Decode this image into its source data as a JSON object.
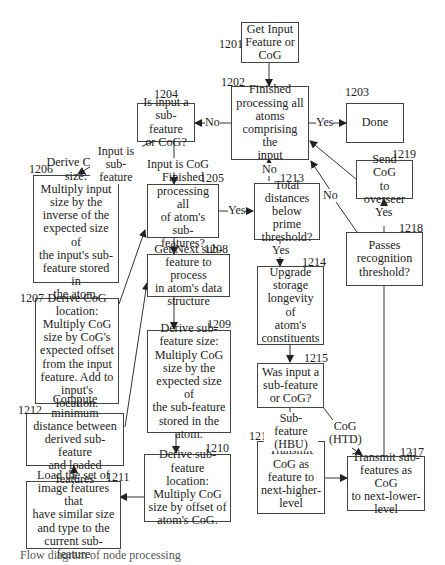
{
  "diagram": {
    "type": "flowchart",
    "nodes": {
      "n1201": {
        "ref": "1201",
        "text": "Get Input\nFeature or\nCoG"
      },
      "n1202": {
        "ref": "1202",
        "text": "Finished\nprocessing all\natoms\ncomprising the\ninput"
      },
      "n1203": {
        "ref": "1203",
        "text": "Done"
      },
      "n1204": {
        "ref": "1204",
        "text": "Is input a\nsub-feature\nor CoG?"
      },
      "n1205": {
        "ref": "1205",
        "text": "Finished\nprocessing all\nof atom's sub-\nfeatures?"
      },
      "n1206": {
        "ref": "1206",
        "text": "Derive CoG size:\nMultiply input\nsize by the\ninverse of the\nexpected size of\nthe input's sub-\nfeature stored in\nthe atom."
      },
      "n1207": {
        "ref": "1207",
        "text": "Derive CoG\nlocation:\nMultiply CoG\nsize by CoG's\nexpected offset\nfrom the input\nfeature.  Add to\ninput's location."
      },
      "n1208": {
        "ref": "1208",
        "text": "Get Next sub-\nfeature to process\nin atom's data\nstructure"
      },
      "n1209": {
        "ref": "1209",
        "text": "Derive sub-\nfeature size:\nMultiply CoG\nsize by the\nexpected size of\nthe sub-feature\nstored in the\natom."
      },
      "n1210": {
        "ref": "1210",
        "text": "Derive sub-\nfeature location:\nMultiply CoG\nsize by offset of\natom's CoG."
      },
      "n1211": {
        "ref": "1211",
        "text": "Load the set of\nimage features that\nhave similar size\nand type to the\ncurrent sub-feature"
      },
      "n1212": {
        "ref": "1212",
        "text": "Compute minimum\ndistance between\nderived sub-feature\nand loaded features"
      },
      "n1213": {
        "ref": "1213",
        "text": "Total\ndistances\nbelow prime\nthreshold?"
      },
      "n1214": {
        "ref": "1214",
        "text": "Upgrade\nstorage\nlongevity of\natom's\nconstituents"
      },
      "n1215": {
        "ref": "1215",
        "text": "Was input a\nsub-feature\nor CoG?"
      },
      "n1216": {
        "ref": "1216",
        "text": "Transmit\nCoG as\nfeature to\nnext-higher-\nlevel"
      },
      "n1217": {
        "ref": "1217",
        "text": "Transmit sub-\nfeatures as CoG\nto next-lower-\nlevel"
      },
      "n1218": {
        "ref": "1218",
        "text": "Passes\nrecognition\nthreshold?"
      },
      "n1219": {
        "ref": "1219",
        "text": "Send CoG\nto overseer"
      }
    },
    "edge_labels": {
      "e1202_1203": "Yes",
      "e1202_1204": "No",
      "e1204_1206": "Input is\nsub-feature",
      "e1204_1205": "Input is CoG",
      "e1205_1213": "Yes",
      "e1213_1202": "No",
      "e1213_1214": "Yes",
      "e1218_1202": "No",
      "e1218_1219": "Yes",
      "e1215_1216": "Sub-feature\n(HBU)",
      "e1215_1217": "CoG\n(HTD)"
    },
    "caption": "Flow diagram of  node processing"
  }
}
